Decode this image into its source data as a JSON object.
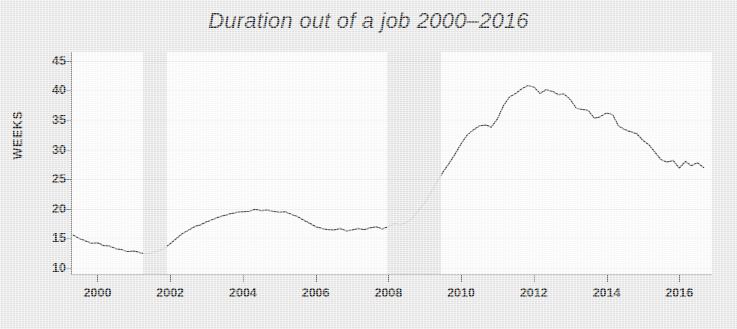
{
  "figure": {
    "title": "Duration out of a job 2000–2016",
    "ylabel": "WEEKS",
    "background_color": "#e8e8e8",
    "plot_background_color": "#fdfdfd",
    "line_color": "#4a4a4a",
    "band_color": "#e3e3e3"
  },
  "chart_data": {
    "type": "line",
    "title": "Duration out of a job 2000–2016",
    "xlabel": "",
    "ylabel": "WEEKS",
    "xlim": [
      1999.3,
      2016.9
    ],
    "ylim": [
      9.0,
      46.5
    ],
    "xticks": [
      2000,
      2002,
      2004,
      2006,
      2008,
      2010,
      2012,
      2014,
      2016
    ],
    "yticks": [
      10,
      15,
      20,
      25,
      30,
      35,
      40,
      45
    ],
    "grid": false,
    "legend": null,
    "shaded_regions": [
      {
        "label": "recession",
        "start": 2001.25,
        "end": 2001.92
      },
      {
        "label": "recession",
        "start": 2007.95,
        "end": 2009.45
      }
    ],
    "series": [
      {
        "name": "Mean duration of unemployment",
        "units": "weeks",
        "x": [
          1999.33,
          1999.5,
          1999.67,
          1999.83,
          2000.0,
          2000.17,
          2000.33,
          2000.5,
          2000.67,
          2000.83,
          2001.0,
          2001.17,
          2001.33,
          2001.5,
          2001.67,
          2001.83,
          2002.0,
          2002.17,
          2002.33,
          2002.5,
          2002.67,
          2002.83,
          2003.0,
          2003.17,
          2003.33,
          2003.5,
          2003.67,
          2003.83,
          2004.0,
          2004.17,
          2004.33,
          2004.5,
          2004.67,
          2004.83,
          2005.0,
          2005.17,
          2005.33,
          2005.5,
          2005.67,
          2005.83,
          2006.0,
          2006.17,
          2006.33,
          2006.5,
          2006.67,
          2006.83,
          2007.0,
          2007.17,
          2007.33,
          2007.5,
          2007.67,
          2007.83,
          2008.0,
          2008.17,
          2008.33,
          2008.5,
          2008.67,
          2008.83,
          2009.0,
          2009.17,
          2009.33,
          2009.5,
          2009.67,
          2009.83,
          2010.0,
          2010.17,
          2010.33,
          2010.5,
          2010.67,
          2010.83,
          2011.0,
          2011.17,
          2011.33,
          2011.5,
          2011.67,
          2011.83,
          2012.0,
          2012.17,
          2012.33,
          2012.5,
          2012.67,
          2012.83,
          2013.0,
          2013.17,
          2013.33,
          2013.5,
          2013.67,
          2013.83,
          2014.0,
          2014.17,
          2014.33,
          2014.5,
          2014.67,
          2014.83,
          2015.0,
          2015.17,
          2015.33,
          2015.5,
          2015.67,
          2015.83,
          2016.0,
          2016.17,
          2016.33,
          2016.5,
          2016.67
        ],
        "y": [
          15.6,
          15.0,
          14.6,
          14.2,
          14.3,
          13.8,
          13.7,
          13.3,
          13.1,
          12.8,
          12.9,
          12.6,
          12.4,
          12.6,
          12.9,
          13.3,
          14.1,
          15.0,
          15.8,
          16.4,
          17.0,
          17.3,
          17.8,
          18.2,
          18.6,
          18.9,
          19.2,
          19.4,
          19.5,
          19.6,
          19.9,
          19.7,
          19.8,
          19.6,
          19.4,
          19.5,
          19.1,
          18.7,
          18.1,
          17.6,
          17.0,
          16.7,
          16.5,
          16.4,
          16.7,
          16.3,
          16.4,
          16.7,
          16.5,
          16.8,
          17.0,
          16.6,
          17.0,
          17.5,
          17.3,
          17.7,
          18.5,
          19.8,
          21.0,
          22.8,
          24.5,
          26.2,
          27.7,
          29.2,
          31.0,
          32.5,
          33.3,
          34.0,
          34.2,
          33.8,
          35.2,
          37.5,
          38.9,
          39.5,
          40.3,
          40.8,
          40.6,
          39.5,
          40.1,
          39.9,
          39.3,
          39.4,
          38.5,
          37.0,
          36.8,
          36.6,
          35.3,
          35.6,
          36.2,
          35.9,
          34.0,
          33.4,
          33.0,
          32.7,
          31.6,
          30.8,
          29.6,
          28.3,
          27.9,
          28.2,
          26.9,
          28.0,
          27.3,
          27.8,
          27.0
        ]
      }
    ]
  },
  "axes": {
    "x_tick_labels": [
      "2000",
      "2002",
      "2004",
      "2006",
      "2008",
      "2010",
      "2012",
      "2014",
      "2016"
    ],
    "y_tick_labels": [
      "10",
      "15",
      "20",
      "25",
      "30",
      "35",
      "40",
      "45"
    ]
  }
}
